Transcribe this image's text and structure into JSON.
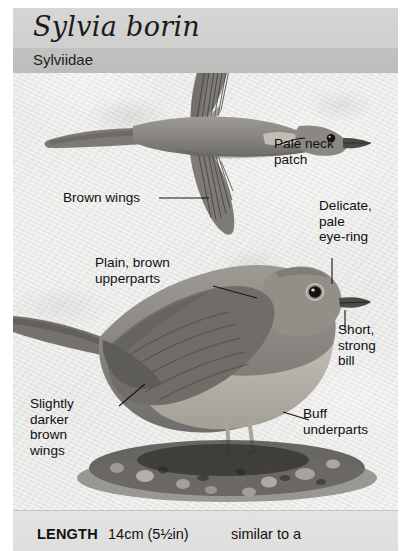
{
  "header": {
    "scientific_name": "Sylvia borin",
    "family": "Sylviidae"
  },
  "caption": {
    "length_label": "LENGTH",
    "length_value": "14cm (5½in)",
    "similar_note": "similar to a"
  },
  "annotations": [
    {
      "id": "pale-neck-patch",
      "text": "Pale neck\npatch"
    },
    {
      "id": "brown-wings",
      "text": "Brown wings"
    },
    {
      "id": "delicate-pale-eyering",
      "text": "Delicate,\npale\neye-ring"
    },
    {
      "id": "plain-brown-upperparts",
      "text": "Plain, brown\nupperparts"
    },
    {
      "id": "short-strong-bill",
      "text": "Short,\nstrong\nbill"
    },
    {
      "id": "slightly-darker-brown-wings",
      "text": "Slightly\ndarker\nbrown\nwings"
    },
    {
      "id": "buff-underparts",
      "text": "Buff\nunderparts"
    }
  ],
  "illustrations": {
    "flying_bird": "garden-warbler-in-flight",
    "perched_bird": "garden-warbler-perched"
  },
  "colors": {
    "title_band": "#d6d6d4",
    "family_band": "#c2c2c0",
    "panel_background": "#e9e9e7",
    "caption_strip": "#e3e3e1",
    "text": "#101010",
    "bird_body": "#8d8b86",
    "bird_dark": "#55534f",
    "bird_underpart": "#b6b2a9"
  }
}
